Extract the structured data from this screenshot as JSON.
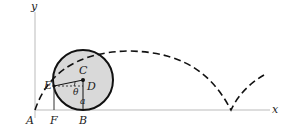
{
  "diagram": {
    "type": "cycloid",
    "labels": {
      "y_axis": "y",
      "x_axis": "x",
      "A": "A",
      "B": "B",
      "C": "C",
      "D": "D",
      "E": "E",
      "F": "F",
      "theta": "θ",
      "radius": "a"
    },
    "colors": {
      "circle_fill": "#d9d9d9",
      "stroke": "#111111",
      "axis": "#bbbbbb"
    }
  }
}
